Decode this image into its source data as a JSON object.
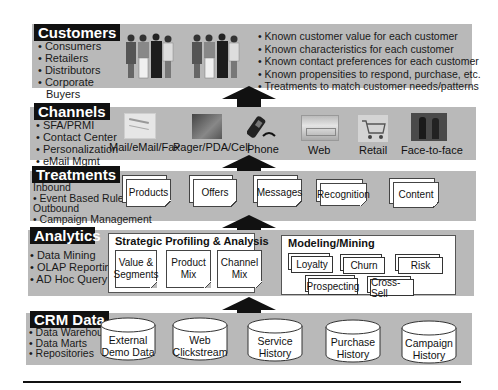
{
  "customers": {
    "label": "Customers",
    "bullets": [
      "• Consumers",
      "• Retailers",
      "• Distributors",
      "• Corporate",
      "  Buyers"
    ],
    "outcomes": [
      "• Known customer value for each customer",
      "• Known characteristics for each customer",
      "• Known contact preferences for each customer",
      "• Known propensities to respond, purchase, etc.",
      "• Treatments to match customer needs/patterns"
    ],
    "image_icon": "people-group-icon"
  },
  "channels": {
    "label": "Channels",
    "bullets": [
      "• SFA/PRMI",
      "• Contact Center",
      "• Personalization",
      "• eMail Mgmt"
    ],
    "items": [
      {
        "label": "Mail/eMail/Fax",
        "icon": "mail-icon"
      },
      {
        "label": "Pager/PDA/Cell",
        "icon": "pager-icon"
      },
      {
        "label": "Phone",
        "icon": "phone-icon"
      },
      {
        "label": "Web",
        "icon": "web-icon"
      },
      {
        "label": "Retail",
        "icon": "shopping-cart-icon"
      },
      {
        "label": "Face-to-face",
        "icon": "handshake-icon"
      }
    ]
  },
  "treatments": {
    "label": "Treatments",
    "lines": [
      "Inbound",
      "• Event Based Rules",
      "Outbound",
      "• Campaign Management"
    ],
    "items": [
      "Products",
      "Offers",
      "Messages",
      "Recognition",
      "Content"
    ]
  },
  "analytics": {
    "label": "Analytics",
    "bullets": [
      "• Data Mining",
      "• OLAP Reporting",
      "• AD Hoc Query"
    ],
    "profiling": {
      "title": "Strategic Profiling & Analysis",
      "items": [
        [
          "Value &",
          "Segments"
        ],
        [
          "Product",
          "Mix"
        ],
        [
          "Channel",
          "Mix"
        ]
      ]
    },
    "modeling": {
      "title": "Modeling/Mining",
      "items": [
        "Loyalty",
        "Churn",
        "Risk",
        "Prospecting",
        "Cross-Sell"
      ]
    }
  },
  "crm_data": {
    "label": "CRM Data",
    "bullets": [
      "• Data Warehouse",
      "• Data Marts",
      "• Repositories"
    ],
    "stores": [
      [
        "External",
        "Demo Data"
      ],
      [
        "Web",
        "Clickstream"
      ],
      [
        "Service",
        "History"
      ],
      [
        "Purchase",
        "History"
      ],
      [
        "Campaign",
        "History"
      ]
    ]
  },
  "colors": {
    "band": "#b9b9b9",
    "label_bg": "#111111",
    "arrow": "#111111"
  }
}
